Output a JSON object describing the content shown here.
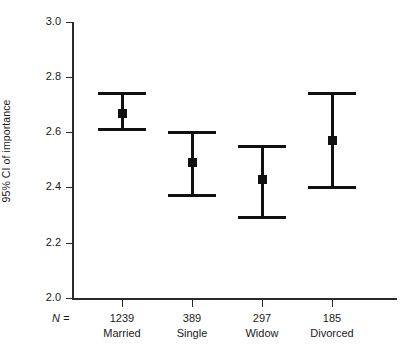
{
  "chart_data": {
    "type": "scatter",
    "title": "",
    "subtitle": "",
    "xlabel": "",
    "ylabel": "95% CI of importance",
    "ylim": [
      2.0,
      3.0
    ],
    "ytick_labels": [
      "3.0",
      "2.8",
      "2.6",
      "2.4",
      "2.2",
      "2.0"
    ],
    "ytick_values": [
      3.0,
      2.8,
      2.6,
      2.4,
      2.2,
      2.0
    ],
    "grid": false,
    "legend": "none",
    "n_prefix": "N =",
    "categories": [
      "Married",
      "Single",
      "Widow",
      "Divorced"
    ],
    "n_values": [
      "1239",
      "389",
      "297",
      "185"
    ],
    "series": [
      {
        "name": "95% CI of importance",
        "mean": [
          2.67,
          2.49,
          2.43,
          2.57
        ],
        "ci_lower": [
          2.61,
          2.37,
          2.29,
          2.4
        ],
        "ci_upper": [
          2.74,
          2.6,
          2.55,
          2.74
        ]
      }
    ],
    "points": [
      {
        "category": "Married",
        "n": "1239",
        "mean": 2.67,
        "ci_lower": 2.61,
        "ci_upper": 2.74
      },
      {
        "category": "Single",
        "n": "389",
        "mean": 2.49,
        "ci_lower": 2.37,
        "ci_upper": 2.6
      },
      {
        "category": "Widow",
        "n": "297",
        "mean": 2.43,
        "ci_lower": 2.29,
        "ci_upper": 2.55
      },
      {
        "category": "Divorced",
        "n": "185",
        "mean": 2.57,
        "ci_lower": 2.4,
        "ci_upper": 2.74
      }
    ],
    "colors": {
      "marker": "#111111",
      "errorbar": "#111111",
      "axis": "#2b2b2b",
      "background": "#ffffff",
      "text": "#1a1a1a"
    }
  }
}
